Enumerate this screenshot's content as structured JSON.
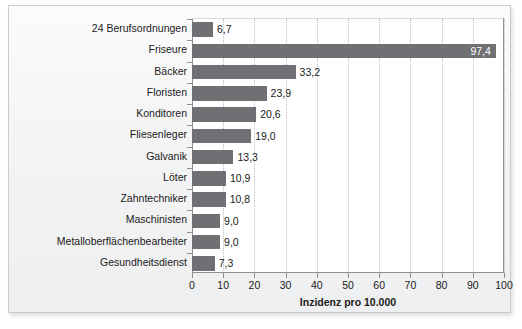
{
  "chart_data": {
    "type": "bar",
    "orientation": "horizontal",
    "title": "",
    "xlabel": "Inzidenz pro 10.000",
    "ylabel": "",
    "xlim": [
      0,
      100
    ],
    "xticks": [
      0,
      10,
      20,
      30,
      40,
      50,
      60,
      70,
      80,
      90,
      100
    ],
    "xtick_labels": [
      "0",
      "10",
      "20",
      "30",
      "40",
      "50",
      "60",
      "70",
      "80",
      "90",
      "100"
    ],
    "grid": "vertical-dotted",
    "legend": null,
    "categories": [
      "24 Berufsordnungen",
      "Friseure",
      "Bäcker",
      "Floristen",
      "Konditoren",
      "Fliesenleger",
      "Galvanik",
      "Löter",
      "Zahntechniker",
      "Maschinisten",
      "Metalloberflächenbearbeiter",
      "Gesundheitsdienst"
    ],
    "values": [
      6.7,
      97.4,
      33.2,
      23.9,
      20.6,
      19.0,
      13.3,
      10.9,
      10.8,
      9.0,
      9.0,
      7.3
    ],
    "value_labels": [
      "6,7",
      "97,4",
      "33,2",
      "23,9",
      "20,6",
      "19,0",
      "13,3",
      "10,9",
      "10,8",
      "9,0",
      "9,0",
      "7,3"
    ],
    "label_placement": [
      "outside",
      "inside",
      "outside",
      "outside",
      "outside",
      "outside",
      "outside",
      "outside",
      "outside",
      "outside",
      "outside",
      "outside"
    ],
    "bar_color": "#6e7073",
    "inside_label_color": "#ffffff",
    "outside_label_color": "#1a1a1a",
    "plot_background": "#ffffff",
    "figure_background": "#f4f4f5",
    "axis_color": "#8e9093",
    "gridline_color": "#b9bbbe"
  }
}
